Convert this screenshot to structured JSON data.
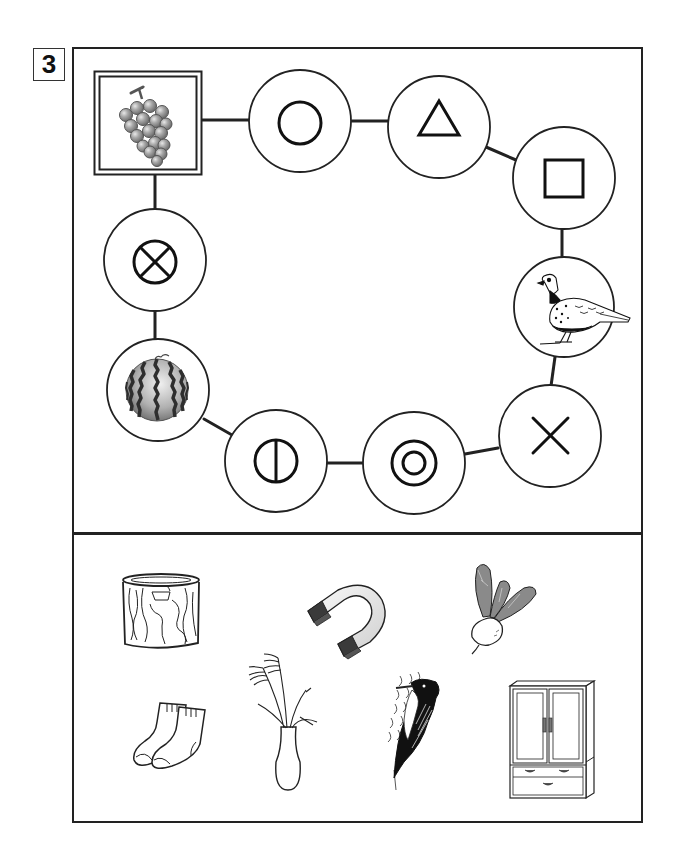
{
  "worksheet": {
    "problem_number": "3",
    "colors": {
      "line": "#222222",
      "fill": "#ffffff",
      "grape": "#9a9a9a",
      "melon_stripe": "#3a3a3a"
    }
  },
  "puzzle": {
    "start_node": {
      "type": "picture",
      "icon": "grapes-icon",
      "frame": "double-square"
    },
    "nodes": [
      {
        "id": "n1",
        "type": "symbol",
        "icon": "circle-icon",
        "glyph": "○"
      },
      {
        "id": "n2",
        "type": "symbol",
        "icon": "triangle-icon",
        "glyph": "△"
      },
      {
        "id": "n3",
        "type": "symbol",
        "icon": "square-icon",
        "glyph": "□"
      },
      {
        "id": "n4",
        "type": "picture",
        "icon": "pheasant-icon"
      },
      {
        "id": "n5",
        "type": "symbol",
        "icon": "cross-icon",
        "glyph": "×"
      },
      {
        "id": "n6",
        "type": "symbol",
        "icon": "double-circle-icon",
        "glyph": "◎"
      },
      {
        "id": "n7",
        "type": "symbol",
        "icon": "circle-vertical-bar-icon",
        "glyph": "⦶"
      },
      {
        "id": "n8",
        "type": "picture",
        "icon": "watermelon-icon"
      },
      {
        "id": "n9",
        "type": "symbol",
        "icon": "circled-x-icon",
        "glyph": "⊗"
      }
    ]
  },
  "answer_choices": [
    {
      "icon": "tree-stump-icon"
    },
    {
      "icon": "magnet-icon"
    },
    {
      "icon": "turnip-icon"
    },
    {
      "icon": "socks-icon"
    },
    {
      "icon": "pampas-grass-vase-icon"
    },
    {
      "icon": "woodpecker-icon"
    },
    {
      "icon": "wardrobe-icon"
    }
  ]
}
